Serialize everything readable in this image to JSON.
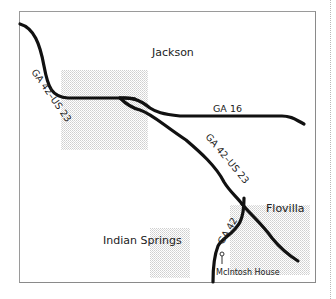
{
  "map": {
    "towns": [
      {
        "name": "Jackson",
        "x": 150,
        "y": 55
      },
      {
        "name": "Flovilla",
        "x": 274,
        "y": 208
      },
      {
        "name": "Indian Springs",
        "x": 148,
        "y": 242
      }
    ],
    "roads": [
      {
        "label": "GA 42–US 23",
        "segment": "northwest"
      },
      {
        "label": "GA 16",
        "segment": "east"
      },
      {
        "label": "GA 42–US 23",
        "segment": "southeast"
      },
      {
        "label": "GA 42",
        "segment": "south"
      }
    ],
    "poi": {
      "label": "McIntosh House",
      "icon": "pin-icon"
    },
    "colors": {
      "road": "#111111",
      "border": "#9a9a9a",
      "town_fill": "#e6e6e6",
      "text": "#222222"
    }
  }
}
